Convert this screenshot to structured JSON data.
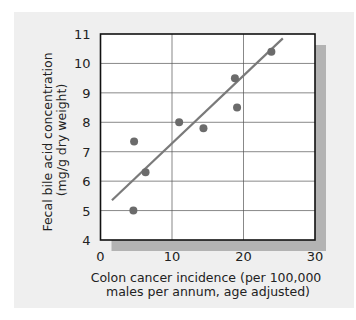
{
  "chart_data": {
    "type": "scatter",
    "title": "",
    "xlabel": "Colon cancer incidence (per 100,000 males per annum, age adjusted)",
    "xlabel_lines": [
      "Colon cancer incidence (per 100,000",
      "males per annum, age adjusted)"
    ],
    "ylabel": "Fecal bile acid concentration (mg/g dry weight)",
    "ylabel_lines": [
      "Fecal bile acid concentration",
      "(mg/g dry weight)"
    ],
    "xlim": [
      0,
      30
    ],
    "ylim": [
      4,
      11
    ],
    "xticks": [
      0,
      10,
      20,
      30
    ],
    "yticks": [
      4,
      5,
      6,
      7,
      8,
      9,
      10,
      11
    ],
    "grid": true,
    "legend": null,
    "points": [
      {
        "x": 4.7,
        "y": 7.35
      },
      {
        "x": 4.6,
        "y": 5.0
      },
      {
        "x": 6.3,
        "y": 6.3
      },
      {
        "x": 11.0,
        "y": 8.0
      },
      {
        "x": 14.4,
        "y": 7.8
      },
      {
        "x": 18.8,
        "y": 9.5
      },
      {
        "x": 19.1,
        "y": 8.5
      },
      {
        "x": 23.9,
        "y": 10.4
      }
    ],
    "trend_line": {
      "x1": 1.6,
      "y1": 5.35,
      "x2": 25.5,
      "y2": 10.85
    },
    "colors": {
      "point": "#6b6b6b",
      "trend_line": "#7a7a7a",
      "panel_background": "#efefef",
      "plot_background": "#ffffff",
      "shadow": "#b3b3b3",
      "grid": "#555555",
      "frame": "#111111"
    }
  }
}
